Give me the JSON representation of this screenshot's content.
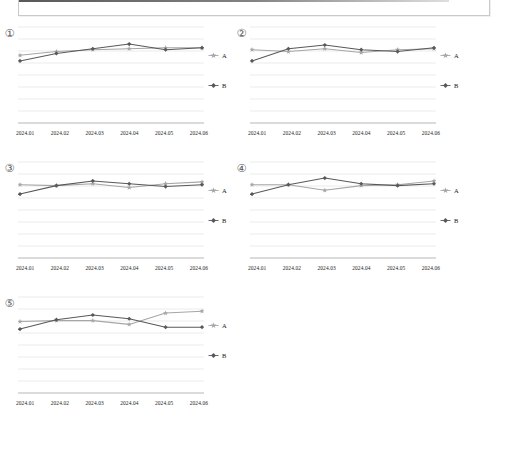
{
  "top_panel": {
    "name": "cut-off-toolbar-panel",
    "border_color": "#c9c9c9"
  },
  "colors": {
    "series_a": "#a6a6a6",
    "series_b": "#595959",
    "gridline": "#d6d6d6",
    "axis": "#9a9a9a",
    "text": "#222222",
    "index_text": "#555555"
  },
  "legend": {
    "series_a_label": "A",
    "series_b_label": "B",
    "series_a_marker": "star-marker-icon",
    "series_b_marker": "diamond-marker-icon"
  },
  "chart_data": [
    {
      "type": "line",
      "index_label": "①",
      "title": "",
      "xlabel": "",
      "ylabel": "",
      "categories": [
        "2024.01",
        "2024.02",
        "2024.03",
        "2024.04",
        "2024.05",
        "2024.06"
      ],
      "ylim": [
        0,
        100
      ],
      "grid": true,
      "legend_position": "right",
      "series": [
        {
          "name": "A",
          "marker": "star",
          "values": [
            72,
            76,
            78,
            79,
            80,
            80
          ]
        },
        {
          "name": "B",
          "marker": "diamond",
          "values": [
            66,
            74,
            79,
            84,
            78,
            80
          ]
        }
      ]
    },
    {
      "type": "line",
      "index_label": "②",
      "title": "",
      "xlabel": "",
      "ylabel": "",
      "categories": [
        "2024.01",
        "2024.02",
        "2024.03",
        "2024.04",
        "2024.05",
        "2024.06"
      ],
      "ylim": [
        0,
        100
      ],
      "grid": true,
      "legend_position": "right",
      "series": [
        {
          "name": "A",
          "marker": "star",
          "values": [
            78,
            76,
            79,
            75,
            78,
            79
          ]
        },
        {
          "name": "B",
          "marker": "diamond",
          "values": [
            66,
            79,
            83,
            78,
            76,
            80
          ]
        }
      ]
    },
    {
      "type": "line",
      "index_label": "③",
      "title": "",
      "xlabel": "",
      "ylabel": "",
      "categories": [
        "2024.01",
        "2024.02",
        "2024.03",
        "2024.04",
        "2024.05",
        "2024.06"
      ],
      "ylim": [
        0,
        100
      ],
      "grid": true,
      "legend_position": "right",
      "series": [
        {
          "name": "A",
          "marker": "star",
          "values": [
            78,
            77,
            79,
            75,
            79,
            81
          ]
        },
        {
          "name": "B",
          "marker": "diamond",
          "values": [
            68,
            77,
            82,
            79,
            76,
            78
          ]
        }
      ]
    },
    {
      "type": "line",
      "index_label": "④",
      "title": "",
      "xlabel": "",
      "ylabel": "",
      "categories": [
        "2024.01",
        "2024.02",
        "2024.03",
        "2024.04",
        "2024.05",
        "2024.06"
      ],
      "ylim": [
        0,
        100
      ],
      "grid": true,
      "legend_position": "right",
      "series": [
        {
          "name": "A",
          "marker": "star",
          "values": [
            78,
            78,
            72,
            77,
            78,
            82
          ]
        },
        {
          "name": "B",
          "marker": "diamond",
          "values": [
            68,
            78,
            85,
            79,
            77,
            79
          ]
        }
      ]
    },
    {
      "type": "line",
      "index_label": "⑤",
      "title": "",
      "xlabel": "",
      "ylabel": "",
      "categories": [
        "2024.01",
        "2024.02",
        "2024.03",
        "2024.04",
        "2024.05",
        "2024.06"
      ],
      "ylim": [
        0,
        100
      ],
      "grid": true,
      "legend_position": "right",
      "series": [
        {
          "name": "A",
          "marker": "star",
          "values": [
            76,
            77,
            77,
            73,
            85,
            87
          ]
        },
        {
          "name": "B",
          "marker": "diamond",
          "values": [
            68,
            78,
            83,
            79,
            70,
            70
          ]
        }
      ]
    }
  ]
}
